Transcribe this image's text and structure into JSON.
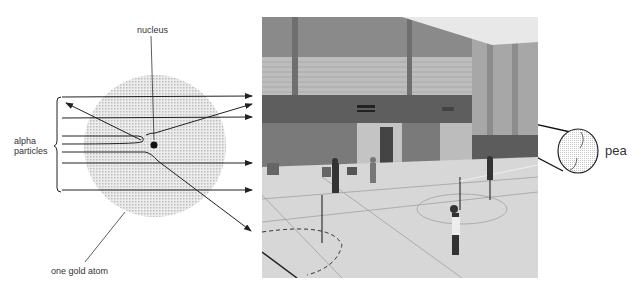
{
  "diagram": {
    "labels": {
      "nucleus": "nucleus",
      "alpha_line1": "alpha",
      "alpha_line2": "particles",
      "gold_atom": "one gold atom",
      "pea": "pea"
    },
    "atom": {
      "cx": 155,
      "cy": 146,
      "r": 70,
      "fill": "#d6d6d6"
    },
    "nucleus_dot": {
      "cx": 155,
      "cy": 146,
      "r": 4,
      "fill": "#111111"
    },
    "line_color": "#222222",
    "photo": {
      "description": "Sports hall with badminton courts and players (analogy for atom scale)"
    }
  }
}
